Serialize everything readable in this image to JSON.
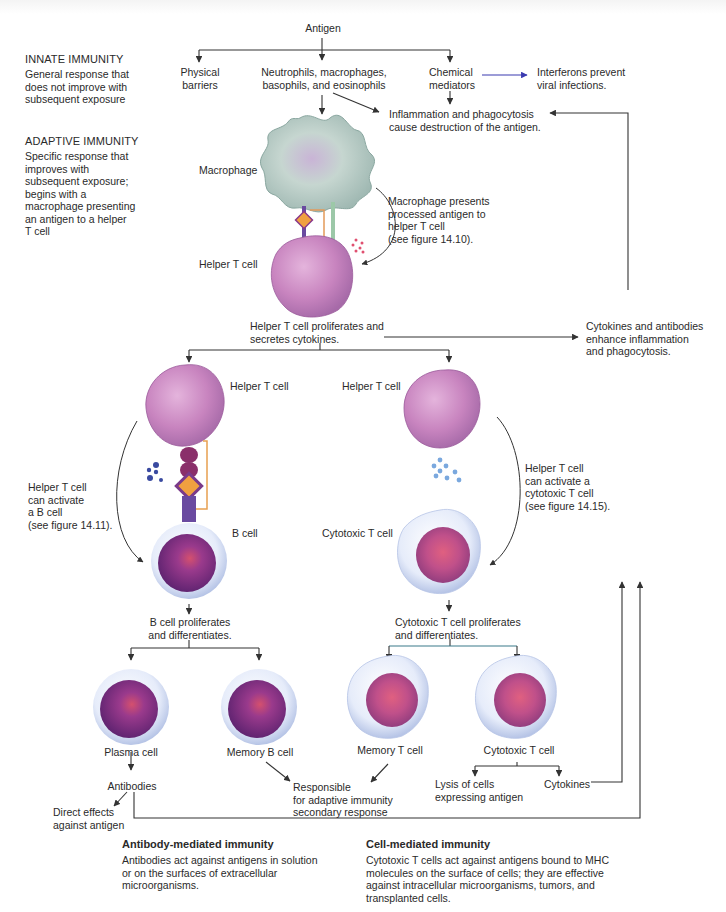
{
  "figure": {
    "root": "Antigen",
    "innate_branches": {
      "physical_barriers": "Physical\nbarriers",
      "phagocytes": "Neutrophils, macrophages,\nbasophils, and eosinophils",
      "chemical_mediators": "Chemical\nmediators",
      "interferons": "Interferons prevent\nviral infections.",
      "inflammation": "Inflammation and phagocytosis\ncause destruction of the antigen."
    },
    "side_labels": {
      "innate_title": "INNATE IMMUNITY",
      "innate_desc": "General response that\ndoes not improve with\nsubsequent exposure",
      "adaptive_title": "ADAPTIVE IMMUNITY",
      "adaptive_desc": "Specific response that\nimproves with\nsubsequent exposure;\nbegins with a\nmacrophage presenting\nan antigen to a helper\nT cell"
    },
    "presentation": {
      "macrophage_label": "Macrophage",
      "helper_t_label": "Helper T cell",
      "note": "Macrophage presents\nprocessed antigen to\nhelper T cell\n(see figure 14.10).",
      "proliferates": "Helper T cell proliferates and\nsecretes cytokines.",
      "cytokines_antibodies": "Cytokines and antibodies\nenhance inflammation\nand phagocytosis."
    },
    "b_branch": {
      "helper_t_label": "Helper T cell",
      "activate_note": "Helper T cell\ncan activate\na B cell\n(see figure 14.11).",
      "b_cell_label": "B cell",
      "proliferates": "B cell proliferates\nand differentiates.",
      "plasma_cell": "Plasma cell",
      "memory_b_cell": "Memory B cell",
      "antibodies": "Antibodies",
      "direct_effects": "Direct effects\nagainst antigen"
    },
    "t_branch": {
      "helper_t_label": "Helper T cell",
      "activate_note": "Helper T cell\ncan activate a\ncytotoxic T cell\n(see figure 14.15).",
      "cytotoxic_t_label": "Cytotoxic T cell",
      "proliferates": "Cytotoxic T cell proliferates\nand differentiates.",
      "memory_t_cell": "Memory T cell",
      "cytotoxic_t_cell": "Cytotoxic T cell",
      "lysis": "Lysis of cells\nexpressing antigen",
      "cytokines": "Cytokines"
    },
    "shared": {
      "secondary_response": "Responsible\nfor adaptive immunity\nsecondary response"
    },
    "captions": {
      "antibody_title": "Antibody-mediated immunity",
      "antibody_desc": "Antibodies act against antigens in solution\nor on the surfaces of extracellular\nmicroorganisms.",
      "cell_title": "Cell-mediated immunity",
      "cell_desc": "Cytotoxic T cells act against antigens bound to MHC\nmolecules on the surface of cells; they are effective\nagainst intracellular microorganisms, tumors, and\ntransplanted cells."
    },
    "colors": {
      "line": "#333333",
      "interferon_arrow": "#3a3ab0",
      "helper_t": "#c27ab8",
      "macrophage": "#b9cfc8",
      "b_cell_nucleus": "#7a2f84",
      "cell_membrane": "#dfe6f6",
      "cytotoxic_nucleus": "#c04f86"
    }
  }
}
